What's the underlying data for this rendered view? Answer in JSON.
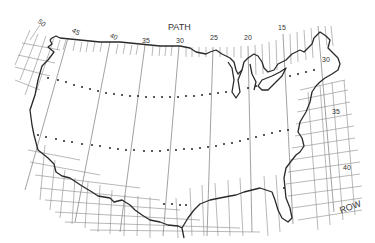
{
  "map": {
    "type": "landsat-path-row-index",
    "region": "Conterminous United States",
    "axis_titles": {
      "path": "PATH",
      "row": "ROW"
    },
    "path_labels": [
      "50",
      "45",
      "40",
      "35",
      "30",
      "25",
      "20",
      "15"
    ],
    "row_labels": [
      "30",
      "35",
      "40"
    ],
    "dotted_row_tracks": 3,
    "colors": {
      "background": "#ffffff",
      "lines": "#8a8a8a",
      "coastline": "#2a2a2a"
    }
  }
}
